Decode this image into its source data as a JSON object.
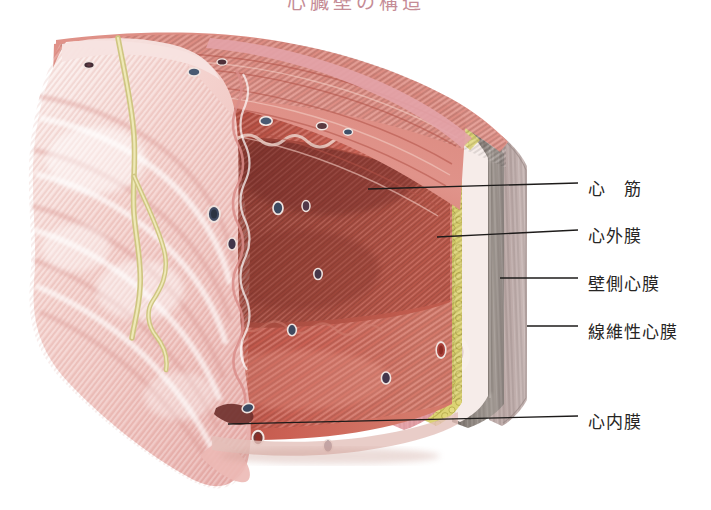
{
  "figure": {
    "kind": "anatomical-illustration",
    "title": "心臓壁の構造",
    "background_color": "#ffffff"
  },
  "labels": [
    {
      "id": "myocardium",
      "text": "心　筋",
      "x": 588,
      "y": 175,
      "line": {
        "x1": 368,
        "y1": 189,
        "x2": 578,
        "y2": 183
      }
    },
    {
      "id": "epicardium",
      "text": "心外膜",
      "x": 588,
      "y": 222,
      "line": {
        "x1": 437,
        "y1": 237,
        "x2": 578,
        "y2": 230
      }
    },
    {
      "id": "parietal-pericardium",
      "text": "壁側心膜",
      "x": 588,
      "y": 270,
      "line": {
        "x1": 500,
        "y1": 278,
        "x2": 578,
        "y2": 278
      }
    },
    {
      "id": "fibrous-pericardium",
      "text": "線維性心膜",
      "x": 588,
      "y": 318,
      "line": {
        "x1": 527,
        "y1": 326,
        "x2": 578,
        "y2": 326
      }
    },
    {
      "id": "endocardium",
      "text": "心内膜",
      "x": 588,
      "y": 408,
      "line": {
        "x1": 228,
        "y1": 424,
        "x2": 578,
        "y2": 416
      }
    }
  ],
  "layers": [
    {
      "id": "endocardium-flap",
      "name": "心内膜 (endocardium, reflected flap)",
      "color": "#f2c3c0"
    },
    {
      "id": "myocardium-deep",
      "name": "心筋 (deep myocardium)",
      "color": "#8d3c34"
    },
    {
      "id": "myocardium-cut",
      "name": "心筋 (cut face)",
      "color": "#c4564b"
    },
    {
      "id": "myocardium-surface",
      "name": "心筋 (striated surface)",
      "color": "#d9776c"
    },
    {
      "id": "epicardium-band",
      "name": "心外膜 (epicardium)",
      "color": "#e5a0a6"
    },
    {
      "id": "subepicardial-fat",
      "name": "脂肪層 (subepicardial fat)",
      "color": "#d8cf6a"
    },
    {
      "id": "serous-pericardium",
      "name": "漿膜性心膜",
      "color": "#f4e9e6"
    },
    {
      "id": "parietal-pericardium",
      "name": "壁側心膜",
      "color": "#8b8079"
    },
    {
      "id": "fibrous-pericardium",
      "name": "線維性心膜",
      "color": "#b8a7a4"
    }
  ]
}
